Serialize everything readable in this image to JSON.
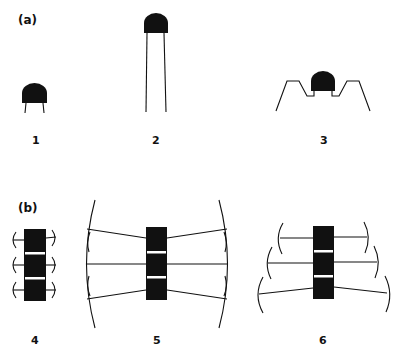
{
  "panels": {
    "a": {
      "label": "(a)"
    },
    "b": {
      "label": "(b)"
    }
  },
  "components": [
    {
      "id": 1,
      "label": "1",
      "kind": "dome-short-leads"
    },
    {
      "id": 2,
      "label": "2",
      "kind": "dome-long-leads"
    },
    {
      "id": 3,
      "label": "3",
      "kind": "dome-bent-leads"
    },
    {
      "id": 4,
      "label": "4",
      "kind": "block-short-leads"
    },
    {
      "id": 5,
      "label": "5",
      "kind": "block-long-converging-leads"
    },
    {
      "id": 6,
      "label": "6",
      "kind": "block-staggered-leads"
    }
  ],
  "colors": {
    "ink": "#111111",
    "background": "#ffffff",
    "stripe": "#ffffff"
  }
}
